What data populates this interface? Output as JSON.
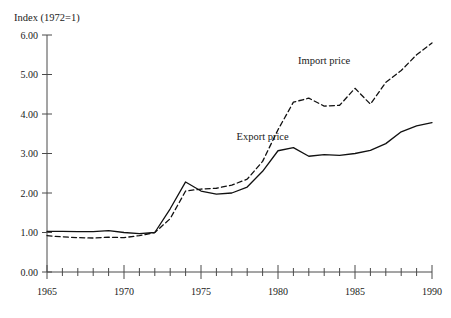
{
  "chart_data": {
    "type": "line",
    "title": "Index (1972=1)",
    "xlabel": "",
    "ylabel": "Index (1972=1)",
    "xlim": [
      1965,
      1990
    ],
    "ylim": [
      0.0,
      6.0
    ],
    "ytick_step": 1.0,
    "xtick_step": 1,
    "grid": false,
    "legend_position": "inline-annotations",
    "y_tick_labels": [
      "0.00",
      "1.00",
      "2.00",
      "3.00",
      "4.00",
      "5.00",
      "6.00"
    ],
    "y_tick_values": [
      0.0,
      1.0,
      2.0,
      3.0,
      4.0,
      5.0,
      6.0
    ],
    "x_tick_labels": [
      "1965",
      "1970",
      "1975",
      "1980",
      "1985",
      "1990"
    ],
    "x_tick_values": [
      1965,
      1970,
      1975,
      1980,
      1985,
      1990
    ],
    "x_minor_ticks": [
      1966,
      1967,
      1968,
      1969,
      1971,
      1972,
      1973,
      1974,
      1976,
      1977,
      1978,
      1979,
      1981,
      1982,
      1983,
      1984,
      1986,
      1987,
      1988,
      1989
    ],
    "x": [
      1965,
      1966,
      1967,
      1968,
      1969,
      1970,
      1971,
      1972,
      1973,
      1974,
      1975,
      1976,
      1977,
      1978,
      1979,
      1980,
      1981,
      1982,
      1983,
      1984,
      1985,
      1986,
      1987,
      1988,
      1989,
      1990
    ],
    "series": [
      {
        "name": "Import price",
        "style": "dashed",
        "color": "#111111",
        "label_x": 1983.0,
        "label_y": 5.27,
        "values": [
          0.92,
          0.89,
          0.87,
          0.86,
          0.88,
          0.87,
          0.92,
          1.0,
          1.35,
          2.05,
          2.1,
          2.12,
          2.2,
          2.35,
          2.8,
          3.6,
          4.3,
          4.4,
          4.2,
          4.22,
          4.65,
          4.25,
          4.8,
          5.1,
          5.5,
          5.8
        ]
      },
      {
        "name": "Export price",
        "style": "solid",
        "color": "#111111",
        "label_x": 1979.0,
        "label_y": 3.33,
        "values": [
          1.03,
          1.03,
          1.02,
          1.02,
          1.05,
          1.0,
          0.97,
          1.0,
          1.6,
          2.28,
          2.05,
          1.97,
          2.0,
          2.15,
          2.55,
          3.07,
          3.15,
          2.93,
          2.97,
          2.95,
          3.0,
          3.08,
          3.25,
          3.55,
          3.7,
          3.78
        ]
      }
    ]
  }
}
